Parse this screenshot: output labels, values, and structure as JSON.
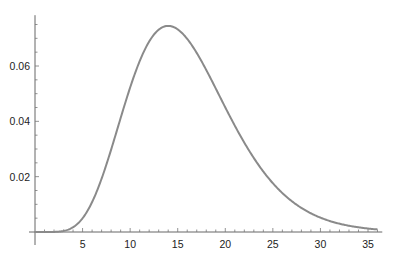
{
  "chart_data": {
    "type": "line",
    "title": "",
    "xlabel": "",
    "ylabel": "",
    "distribution": {
      "name": "chi-square",
      "df": 16
    },
    "xlim": [
      0,
      36.5
    ],
    "ylim": [
      0,
      0.078
    ],
    "x_ticks": [
      5,
      10,
      15,
      20,
      25,
      30,
      35
    ],
    "x_tick_labels": [
      "5",
      "10",
      "15",
      "20",
      "25",
      "30",
      "35"
    ],
    "x_minor_step": 1,
    "y_ticks": [
      0.02,
      0.04,
      0.06
    ],
    "y_tick_labels": [
      "0.02",
      "0.04",
      "0.06"
    ],
    "y_minor_step": 0.005,
    "grid": false,
    "legend": "none",
    "series": [
      {
        "name": "pdf",
        "color": "#8a8a8a",
        "x": [
          0,
          2,
          4,
          6,
          8,
          10,
          12,
          14,
          16,
          18,
          20,
          22,
          24,
          26,
          28,
          30,
          32,
          34,
          36
        ],
        "y": [
          0,
          4e-05,
          0.0017,
          0.0113,
          0.0298,
          0.0505,
          0.0669,
          0.0745,
          0.0729,
          0.064,
          0.0517,
          0.039,
          0.0277,
          0.0187,
          0.0121,
          0.0075,
          0.0045,
          0.0026,
          0.0015
        ]
      }
    ],
    "x_range_plotted": [
      0,
      36
    ]
  }
}
